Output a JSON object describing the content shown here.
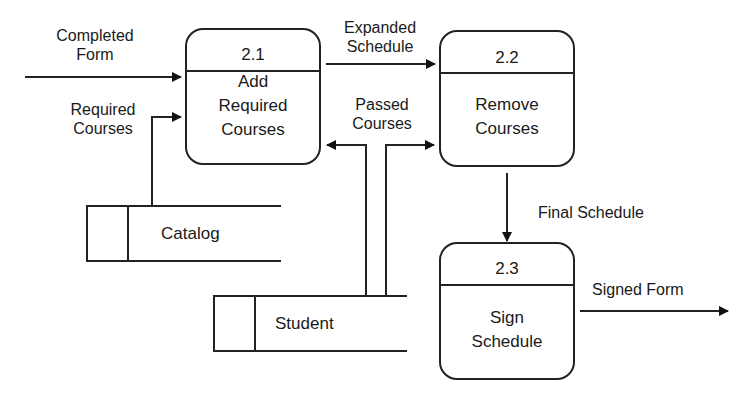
{
  "diagram": {
    "type": "data-flow-diagram",
    "processes": [
      {
        "id": "2.1",
        "number": "2.1",
        "name_lines": [
          "Add",
          "Required",
          "Courses"
        ]
      },
      {
        "id": "2.2",
        "number": "2.2",
        "name_lines": [
          "Remove",
          "Courses"
        ]
      },
      {
        "id": "2.3",
        "number": "2.3",
        "name_lines": [
          "Sign",
          "Schedule"
        ]
      }
    ],
    "data_stores": [
      {
        "name": "Catalog"
      },
      {
        "name": "Student"
      }
    ],
    "flows": [
      {
        "label_lines": [
          "Completed",
          "Form"
        ],
        "from": "external",
        "to": "2.1"
      },
      {
        "label_lines": [
          "Required",
          "Courses"
        ],
        "from": "Catalog",
        "to": "2.1"
      },
      {
        "label_lines": [
          "Expanded",
          "Schedule"
        ],
        "from": "2.1",
        "to": "2.2"
      },
      {
        "label_lines": [
          "Passed",
          "Courses"
        ],
        "from": "Student",
        "to": [
          "2.1",
          "2.2"
        ]
      },
      {
        "label_lines": [
          "Final Schedule"
        ],
        "from": "2.2",
        "to": "2.3"
      },
      {
        "label_lines": [
          "Signed Form"
        ],
        "from": "2.3",
        "to": "external"
      }
    ],
    "colors": {
      "line": "#222222",
      "background": "#ffffff"
    }
  }
}
